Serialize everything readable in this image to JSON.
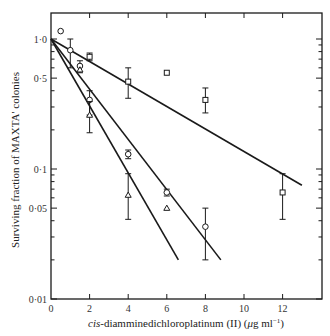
{
  "chart_data": {
    "type": "scatter",
    "title": "",
    "xlabel": "cis-diamminedichloroplatinum (II) (μg ml⁻¹)",
    "xlabel_italic_prefix": "cis",
    "xlabel_rest": "-diamminedichloroplatinum (II) (",
    "xlabel_unit_mu": "μ",
    "xlabel_unit_rest": "g ml",
    "xlabel_sup": "−1",
    "xlabel_close": ")",
    "ylabel": "Surviving fraction of MAXTA' colonies",
    "xlim": [
      0,
      14
    ],
    "ylim": [
      0.01,
      1.5
    ],
    "yscale": "log",
    "grid": false,
    "legend": null,
    "x_ticks": [
      0,
      2,
      4,
      6,
      8,
      10,
      12
    ],
    "x_tick_labels": [
      "0",
      "2",
      "4",
      "6",
      "8",
      "10",
      "12"
    ],
    "y_ticks": [
      1.0,
      0.5,
      0.1,
      0.05,
      0.01
    ],
    "y_tick_labels": [
      "1·0",
      "0·5",
      "0·1",
      "0·05",
      "0·01"
    ],
    "series": [
      {
        "name": "squares",
        "marker": "square",
        "points": [
          {
            "x": 2,
            "y": 0.73,
            "err_lo": 0.68,
            "err_hi": 0.78
          },
          {
            "x": 4,
            "y": 0.47,
            "err_lo": 0.35,
            "err_hi": 0.6
          },
          {
            "x": 6,
            "y": 0.55
          },
          {
            "x": 8,
            "y": 0.34,
            "err_lo": 0.27,
            "err_hi": 0.42
          },
          {
            "x": 12,
            "y": 0.066,
            "err_lo": 0.041,
            "err_hi": 0.092
          }
        ],
        "fit_line": {
          "x0": 0,
          "y0": 1.0,
          "x1": 13,
          "y1": 0.075
        }
      },
      {
        "name": "circles",
        "marker": "circle",
        "points": [
          {
            "x": 0.5,
            "y": 1.15
          },
          {
            "x": 1,
            "y": 0.82,
            "err_lo": 0.6,
            "err_hi": 1.0
          },
          {
            "x": 1.5,
            "y": 0.62,
            "err_lo": 0.55,
            "err_hi": 0.68
          },
          {
            "x": 2,
            "y": 0.34,
            "err_lo": 0.26,
            "err_hi": 0.4
          },
          {
            "x": 4,
            "y": 0.13,
            "err_lo": 0.12,
            "err_hi": 0.14
          },
          {
            "x": 6,
            "y": 0.066,
            "err_lo": 0.062,
            "err_hi": 0.07
          },
          {
            "x": 8,
            "y": 0.036,
            "err_lo": 0.02,
            "err_hi": 0.05
          }
        ],
        "fit_line": {
          "x0": 0,
          "y0": 1.0,
          "x1": 8.8,
          "y1": 0.02
        }
      },
      {
        "name": "triangles",
        "marker": "triangle",
        "points": [
          {
            "x": 1.5,
            "y": 0.58
          },
          {
            "x": 2,
            "y": 0.26,
            "err_lo": 0.19,
            "err_hi": 0.33
          },
          {
            "x": 4,
            "y": 0.063,
            "err_lo": 0.041,
            "err_hi": 0.092
          },
          {
            "x": 6,
            "y": 0.05
          }
        ],
        "fit_line": {
          "x0": 0,
          "y0": 1.0,
          "x1": 6.6,
          "y1": 0.02
        }
      }
    ]
  },
  "colors": {
    "ink": "#1a1a1a",
    "background": "#ffffff"
  }
}
